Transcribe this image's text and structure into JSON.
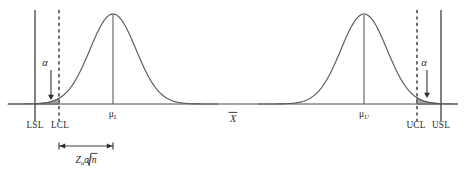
{
  "figure": {
    "type": "statistical-distribution-diagram",
    "background_color": "#ffffff",
    "line_color": "#4d4d4d",
    "shade_color": "#9b9b9b"
  },
  "axis": {
    "label": "X̅",
    "label_plain": "X-bar",
    "baseline_y": 104,
    "x_start": 8,
    "x_end": 458
  },
  "limits": [
    {
      "id": "lsl",
      "label": "LSL",
      "full_name": "Lower Specification Limit",
      "x": 35,
      "style": "solid",
      "label_x": 35,
      "label_y": 128
    },
    {
      "id": "lcl",
      "label": "LCL",
      "full_name": "Lower Control Limit",
      "x": 59,
      "style": "dashed",
      "label_x": 60,
      "label_y": 128
    },
    {
      "id": "ucl",
      "label": "UCL",
      "full_name": "Upper Control Limit",
      "x": 417,
      "style": "dashed",
      "label_x": 416,
      "label_y": 128
    },
    {
      "id": "usl",
      "label": "USL",
      "full_name": "Upper Specification Limit",
      "x": 441,
      "style": "solid",
      "label_x": 441,
      "label_y": 128
    }
  ],
  "distributions": [
    {
      "id": "lower",
      "mean_label": "μ",
      "mean_subscript": "L",
      "mean_x": 113,
      "peak_y": 14,
      "sigma": 23,
      "label_y": 117,
      "tail_side": "left",
      "tail_boundary_x": 59
    },
    {
      "id": "upper",
      "mean_label": "μ",
      "mean_subscript": "U",
      "mean_x": 364,
      "peak_y": 14,
      "sigma": 23,
      "label_y": 117,
      "tail_side": "right",
      "tail_boundary_x": 417
    }
  ],
  "alpha_annotations": [
    {
      "id": "alpha-left",
      "label": "α",
      "label_x": 45,
      "label_y": 66,
      "arrow_x": 51,
      "arrow_top_y": 70,
      "arrow_bottom_y": 100
    },
    {
      "id": "alpha-right",
      "label": "α",
      "label_x": 424,
      "label_y": 66,
      "arrow_x": 427,
      "arrow_top_y": 70,
      "arrow_bottom_y": 98
    }
  ],
  "dimension": {
    "id": "z-alpha-sigma-sqrt-n",
    "formula_main": "Z",
    "formula_subscript": "α",
    "formula_rest": "σ/",
    "formula_radical": "n",
    "formula_plain": "Zασ/√n",
    "x_start": 59,
    "x_end": 113,
    "y": 146,
    "label_x": 86,
    "label_y": 163
  }
}
